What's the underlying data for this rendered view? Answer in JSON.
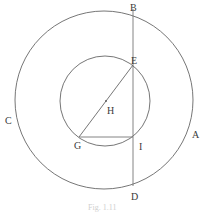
{
  "diagram": {
    "stroke_color": "#666666",
    "label_color": "#3a3a3a",
    "outer_circle": {
      "cx": 104,
      "cy": 100,
      "r": 89
    },
    "inner_circle": {
      "cx": 105,
      "cy": 101,
      "r": 45
    },
    "lines": [
      {
        "name": "BD",
        "x1": 133,
        "y1": 9,
        "x2": 133,
        "y2": 186
      },
      {
        "name": "EG",
        "x1": 133,
        "y1": 65,
        "x2": 79,
        "y2": 137
      },
      {
        "name": "GI",
        "x1": 79,
        "y1": 137,
        "x2": 133,
        "y2": 137
      }
    ],
    "center_point": {
      "name": "H",
      "x": 106,
      "y": 101
    },
    "labels": {
      "A": "A",
      "B": "B",
      "C": "C",
      "D": "D",
      "E": "E",
      "G": "G",
      "H": "H",
      "I": "I"
    },
    "caption": "Fig. 1.11"
  }
}
